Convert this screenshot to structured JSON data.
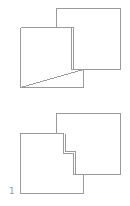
{
  "figures": [
    {
      "id": "top",
      "description": "two overlapping squares"
    },
    {
      "id": "bottom",
      "description": "two overlapping squares with stepped overlap edge",
      "label": "1"
    }
  ],
  "colors": {
    "stroke": "#9a9a9a",
    "background": "#ffffff"
  }
}
